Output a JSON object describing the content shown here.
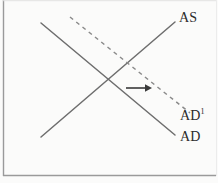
{
  "figure": {
    "kind": "as-ad-diagram",
    "background_color": "#fbfbfa",
    "border_color": "#9a9a9a",
    "line_color": "#6e6e6e",
    "arrow_color": "#3a3a3a",
    "label_color": "#2b2b2b"
  },
  "labels": {
    "as": "AS",
    "ad": "AD",
    "ad_shifted_base": "AD",
    "ad_shifted_sup": "1"
  },
  "chart_data": {
    "type": "line",
    "title": "",
    "xlabel": "",
    "ylabel": "",
    "grid": false,
    "legend": "none",
    "annotations": [
      {
        "name": "shift-arrow",
        "kind": "arrow",
        "direction": "right",
        "x1": 126,
        "y1": 88,
        "x2": 150,
        "y2": 88
      }
    ],
    "series": [
      {
        "name": "AS",
        "label": "AS",
        "style": "solid",
        "slope": "upward",
        "points": [
          [
            41,
            137
          ],
          [
            175,
            22
          ]
        ]
      },
      {
        "name": "AD",
        "label": "AD",
        "style": "solid",
        "slope": "downward",
        "points": [
          [
            41,
            23
          ],
          [
            175,
            135
          ]
        ]
      },
      {
        "name": "AD1",
        "label": "AD1",
        "style": "dashed",
        "slope": "downward",
        "points": [
          [
            70,
            17
          ],
          [
            190,
            113
          ]
        ]
      }
    ],
    "intersections": [
      {
        "name": "initial-equilibrium",
        "series": [
          "AS",
          "AD"
        ],
        "x": 108,
        "y": 80
      },
      {
        "name": "new-equilibrium",
        "series": [
          "AS",
          "AD1"
        ],
        "x": 141,
        "y": 74
      }
    ]
  }
}
